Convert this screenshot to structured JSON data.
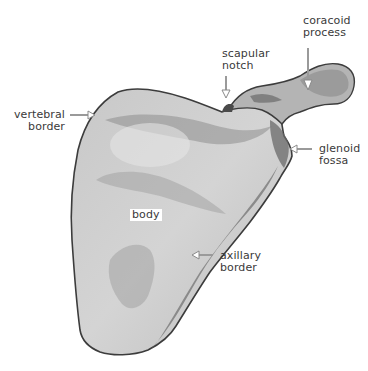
{
  "diagram": {
    "subject": "scapula",
    "labels": {
      "coracoid_process": {
        "line1": "coracoid",
        "line2": "process"
      },
      "scapular_notch": {
        "line1": "scapular",
        "line2": "notch"
      },
      "vertebral_border": {
        "line1": "vertebral",
        "line2": "border"
      },
      "glenoid_fossa": {
        "line1": "glenoid",
        "line2": "fossa"
      },
      "body": {
        "line1": "body"
      },
      "axillary_border": {
        "line1": "axillary",
        "line2": "border"
      }
    },
    "colors": {
      "bone_light": "#d6d6d6",
      "bone_mid": "#a8a8a8",
      "bone_dark": "#5a5a5a",
      "outline": "#3c3c3c",
      "arrow": "#9a9a9a",
      "text": "#3a3a3a"
    }
  }
}
